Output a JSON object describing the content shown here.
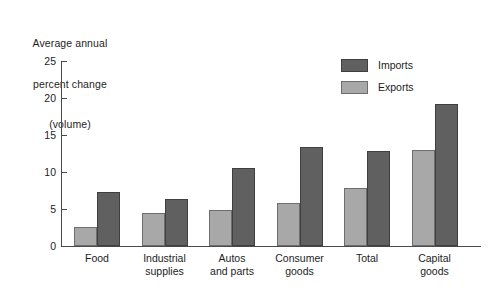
{
  "chart_data": {
    "type": "bar",
    "title": "Average annual percent change (volume)",
    "title_lines": [
      "Average annual",
      "percent change",
      "(volume)"
    ],
    "xlabel": "",
    "ylabel": "Average annual percent change (volume)",
    "ylim": [
      0,
      25
    ],
    "yticks": [
      0,
      5,
      10,
      15,
      20,
      25
    ],
    "ytick_labels": [
      "0",
      "5",
      "10",
      "15",
      "20",
      "25"
    ],
    "grid": false,
    "legend_position": "top-right",
    "categories": [
      "Food",
      "Industrial supplies",
      "Autos and parts",
      "Consumer goods",
      "Total",
      "Capital goods"
    ],
    "category_label_lines": [
      [
        "Food"
      ],
      [
        "Industrial",
        "supplies"
      ],
      [
        "Autos",
        "and parts"
      ],
      [
        "Consumer",
        "goods"
      ],
      [
        "Total"
      ],
      [
        "Capital",
        "goods"
      ]
    ],
    "series": [
      {
        "name": "Exports",
        "color": "#a8a8a8",
        "values": [
          2.6,
          4.4,
          4.8,
          5.8,
          7.9,
          13.0
        ]
      },
      {
        "name": "Imports",
        "color": "#606060",
        "values": [
          7.3,
          6.4,
          10.6,
          13.4,
          12.9,
          19.2
        ]
      }
    ]
  },
  "legend": {
    "entries": [
      {
        "label": "Imports",
        "swatch": "imports"
      },
      {
        "label": "Exports",
        "swatch": "exports"
      }
    ]
  },
  "colors": {
    "imports": "#606060",
    "exports": "#a8a8a8",
    "axis": "#4a4a4a",
    "text": "#1d1d1d",
    "background": "#ffffff"
  }
}
